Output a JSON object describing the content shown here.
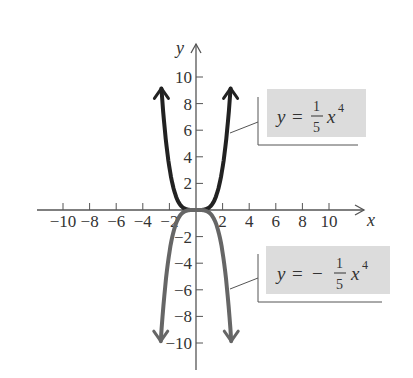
{
  "chart_data": {
    "type": "line",
    "title": "",
    "xlabel": "x",
    "ylabel": "y",
    "xlim": [
      -11,
      11
    ],
    "ylim": [
      -12,
      12
    ],
    "grid": false,
    "x_ticks": [
      -10,
      -8,
      -6,
      -4,
      -2,
      2,
      4,
      6,
      8,
      10
    ],
    "y_ticks": [
      10,
      8,
      6,
      4,
      2,
      -2,
      -4,
      -6,
      -8,
      -10
    ],
    "x_tick_labels": [
      "−10",
      "−8",
      "−6",
      "−4",
      "−2",
      "2",
      "4",
      "6",
      "8",
      "10"
    ],
    "y_tick_labels": [
      "10",
      "8",
      "6",
      "4",
      "2",
      "−2",
      "−4",
      "−6",
      "−8",
      "−10"
    ],
    "series": [
      {
        "name": "y = (1/5)x^4",
        "label": {
          "lhs": "y =",
          "num": "1",
          "den": "5",
          "var": "x",
          "exp": "4",
          "sign": ""
        },
        "color": "#222222",
        "coefficient": 0.2,
        "x": [
          -2.6,
          -2,
          -1.5,
          -1,
          -0.5,
          0,
          0.5,
          1,
          1.5,
          2,
          2.6
        ],
        "y": [
          9.14,
          3.2,
          1.01,
          0.2,
          0.0125,
          0,
          0.0125,
          0.2,
          1.01,
          3.2,
          9.14
        ]
      },
      {
        "name": "y = -(1/5)x^4",
        "label": {
          "lhs": "y =",
          "num": "1",
          "den": "5",
          "var": "x",
          "exp": "4",
          "sign": "−"
        },
        "color": "#666666",
        "coefficient": -0.2,
        "x": [
          -2.65,
          -2,
          -1.5,
          -1,
          -0.5,
          0,
          0.5,
          1,
          1.5,
          2,
          2.65
        ],
        "y": [
          -9.86,
          -3.2,
          -1.01,
          -0.2,
          -0.0125,
          0,
          -0.0125,
          -0.2,
          -1.01,
          -3.2,
          -9.86
        ]
      }
    ]
  },
  "axes": {
    "x_label": "x",
    "y_label": "y"
  },
  "labels": {
    "upper": {
      "lhs": "y =",
      "sign": "",
      "num": "1",
      "den": "5",
      "var": "x",
      "exp": "4"
    },
    "lower": {
      "lhs": "y =",
      "sign": "−",
      "num": "1",
      "den": "5",
      "var": "x",
      "exp": "4"
    }
  },
  "colors": {
    "upper_curve": "#222222",
    "lower_curve": "#666666",
    "label_box": "#dcdcdc",
    "axis": "#555555"
  }
}
